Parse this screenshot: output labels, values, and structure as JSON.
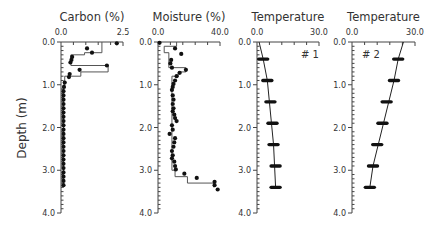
{
  "figure": {
    "ylabel": "Depth (m)",
    "depth_ticks": [
      0.0,
      1.0,
      2.0,
      3.0,
      4.0
    ],
    "depth_tick_labels": [
      "0.0",
      "1.0",
      "2.0",
      "3.0",
      "4.0"
    ]
  },
  "chart_data": [
    {
      "type": "scatter",
      "title": "Carbon (%)",
      "xlabel": "Carbon (%)",
      "ylabel": "Depth (m)",
      "xlim": [
        0.0,
        2.5
      ],
      "ylim": [
        4.0,
        0.0
      ],
      "xtick_labels": [
        "0.0",
        "2.5"
      ],
      "points": [
        {
          "x": 2.25,
          "y": 0.03
        },
        {
          "x": 1.05,
          "y": 0.15
        },
        {
          "x": 1.25,
          "y": 0.25
        },
        {
          "x": 0.45,
          "y": 0.35
        },
        {
          "x": 0.42,
          "y": 0.42
        },
        {
          "x": 0.38,
          "y": 0.48
        },
        {
          "x": 1.85,
          "y": 0.55
        },
        {
          "x": 0.75,
          "y": 0.65
        },
        {
          "x": 0.35,
          "y": 0.75
        },
        {
          "x": 0.32,
          "y": 0.82
        },
        {
          "x": 0.15,
          "y": 0.95
        },
        {
          "x": 0.12,
          "y": 1.05
        },
        {
          "x": 0.1,
          "y": 1.15
        },
        {
          "x": 0.1,
          "y": 1.25
        },
        {
          "x": 0.1,
          "y": 1.35
        },
        {
          "x": 0.1,
          "y": 1.45
        },
        {
          "x": 0.1,
          "y": 1.55
        },
        {
          "x": 0.1,
          "y": 1.65
        },
        {
          "x": 0.1,
          "y": 1.75
        },
        {
          "x": 0.1,
          "y": 1.85
        },
        {
          "x": 0.1,
          "y": 1.95
        },
        {
          "x": 0.1,
          "y": 2.05
        },
        {
          "x": 0.1,
          "y": 2.15
        },
        {
          "x": 0.1,
          "y": 2.25
        },
        {
          "x": 0.1,
          "y": 2.35
        },
        {
          "x": 0.1,
          "y": 2.45
        },
        {
          "x": 0.1,
          "y": 2.55
        },
        {
          "x": 0.1,
          "y": 2.65
        },
        {
          "x": 0.1,
          "y": 2.75
        },
        {
          "x": 0.1,
          "y": 2.85
        },
        {
          "x": 0.1,
          "y": 2.95
        },
        {
          "x": 0.1,
          "y": 3.05
        },
        {
          "x": 0.1,
          "y": 3.15
        },
        {
          "x": 0.1,
          "y": 3.25
        },
        {
          "x": 0.1,
          "y": 3.35
        }
      ],
      "step_profile": [
        [
          1.65,
          0.0
        ],
        [
          1.65,
          0.25
        ],
        [
          0.95,
          0.25
        ],
        [
          0.95,
          0.3
        ],
        [
          0.4,
          0.3
        ],
        [
          0.4,
          0.55
        ],
        [
          1.9,
          0.55
        ],
        [
          1.9,
          0.7
        ],
        [
          0.8,
          0.7
        ],
        [
          0.8,
          0.8
        ],
        [
          0.15,
          0.8
        ],
        [
          0.15,
          1.0
        ],
        [
          0.1,
          1.0
        ],
        [
          0.1,
          3.4
        ]
      ]
    },
    {
      "type": "scatter",
      "title": "Moisture (%)",
      "xlabel": "Moisture (%)",
      "ylabel": "Depth (m)",
      "xlim": [
        0.0,
        40.0
      ],
      "ylim": [
        4.0,
        0.0
      ],
      "xtick_labels": [
        "0.0",
        "40.0"
      ],
      "points": [
        {
          "x": 1.0,
          "y": 0.02
        },
        {
          "x": 11.0,
          "y": 0.15
        },
        {
          "x": 15.0,
          "y": 0.28
        },
        {
          "x": 8.5,
          "y": 0.42
        },
        {
          "x": 8.0,
          "y": 0.5
        },
        {
          "x": 9.0,
          "y": 0.6
        },
        {
          "x": 18.0,
          "y": 0.65
        },
        {
          "x": 14.0,
          "y": 0.72
        },
        {
          "x": 12.0,
          "y": 0.8
        },
        {
          "x": 11.0,
          "y": 0.9
        },
        {
          "x": 10.0,
          "y": 0.98
        },
        {
          "x": 9.5,
          "y": 1.05
        },
        {
          "x": 9.0,
          "y": 1.12
        },
        {
          "x": 9.5,
          "y": 1.25
        },
        {
          "x": 10.0,
          "y": 1.35
        },
        {
          "x": 9.5,
          "y": 1.45
        },
        {
          "x": 10.0,
          "y": 1.55
        },
        {
          "x": 9.5,
          "y": 1.62
        },
        {
          "x": 10.5,
          "y": 1.7
        },
        {
          "x": 11.0,
          "y": 1.78
        },
        {
          "x": 12.0,
          "y": 1.85
        },
        {
          "x": 9.0,
          "y": 1.95
        },
        {
          "x": 9.5,
          "y": 2.05
        },
        {
          "x": 7.5,
          "y": 2.15
        },
        {
          "x": 11.0,
          "y": 2.25
        },
        {
          "x": 10.5,
          "y": 2.35
        },
        {
          "x": 10.0,
          "y": 2.45
        },
        {
          "x": 9.0,
          "y": 2.55
        },
        {
          "x": 9.5,
          "y": 2.65
        },
        {
          "x": 9.0,
          "y": 2.72
        },
        {
          "x": 10.5,
          "y": 2.8
        },
        {
          "x": 11.0,
          "y": 2.9
        },
        {
          "x": 11.5,
          "y": 2.98
        },
        {
          "x": 17.0,
          "y": 3.08
        },
        {
          "x": 25.0,
          "y": 3.18
        },
        {
          "x": 36.5,
          "y": 3.27
        },
        {
          "x": 36.5,
          "y": 3.35
        },
        {
          "x": 38.5,
          "y": 3.45
        }
      ],
      "step_profile": [
        [
          12.0,
          0.0
        ],
        [
          12.0,
          0.1
        ],
        [
          4.0,
          0.1
        ],
        [
          4.0,
          0.25
        ],
        [
          7.0,
          0.25
        ],
        [
          7.0,
          0.6
        ],
        [
          18.0,
          0.6
        ],
        [
          18.0,
          0.7
        ],
        [
          13.0,
          0.7
        ],
        [
          13.0,
          0.8
        ],
        [
          9.0,
          0.8
        ],
        [
          9.0,
          3.0
        ],
        [
          11.0,
          3.0
        ],
        [
          11.0,
          3.15
        ],
        [
          19.0,
          3.15
        ],
        [
          19.0,
          3.3
        ],
        [
          36.0,
          3.3
        ],
        [
          36.0,
          3.4
        ]
      ]
    },
    {
      "type": "line",
      "title": "Temperature",
      "annotation": "# 1",
      "xlabel": "Temperature",
      "ylabel": "Depth (m)",
      "xlim": [
        0.0,
        30.0
      ],
      "ylim": [
        4.0,
        0.0
      ],
      "xtick_labels": [
        "0.0",
        "30.0"
      ],
      "line": [
        [
          1.0,
          0.0
        ],
        [
          3.0,
          0.4
        ],
        [
          5.0,
          0.9
        ],
        [
          6.0,
          1.4
        ],
        [
          7.0,
          1.9
        ],
        [
          8.0,
          2.4
        ],
        [
          8.5,
          2.9
        ],
        [
          9.0,
          3.4
        ]
      ],
      "measurements": [
        {
          "x": 3.0,
          "y": 0.4
        },
        {
          "x": 5.0,
          "y": 0.9
        },
        {
          "x": 6.5,
          "y": 1.4
        },
        {
          "x": 7.5,
          "y": 1.9
        },
        {
          "x": 8.0,
          "y": 2.4
        },
        {
          "x": 9.0,
          "y": 2.9
        },
        {
          "x": 9.0,
          "y": 3.4
        }
      ]
    },
    {
      "type": "line",
      "title": "Temperature",
      "annotation": "# 2",
      "xlabel": "Temperature",
      "ylabel": "Depth (m)",
      "xlim": [
        0.0,
        30.0
      ],
      "ylim": [
        4.0,
        0.0
      ],
      "xtick_labels": [
        "0.0",
        "30.0"
      ],
      "line": [
        [
          24.5,
          0.0
        ],
        [
          22.0,
          0.4
        ],
        [
          20.0,
          0.9
        ],
        [
          17.5,
          1.4
        ],
        [
          15.0,
          1.9
        ],
        [
          12.5,
          2.4
        ],
        [
          10.0,
          2.9
        ],
        [
          8.5,
          3.4
        ]
      ],
      "measurements": [
        {
          "x": 22.0,
          "y": 0.4
        },
        {
          "x": 20.0,
          "y": 0.9
        },
        {
          "x": 16.5,
          "y": 1.4
        },
        {
          "x": 14.5,
          "y": 1.9
        },
        {
          "x": 12.0,
          "y": 2.4
        },
        {
          "x": 10.0,
          "y": 2.9
        },
        {
          "x": 8.5,
          "y": 3.4
        }
      ]
    }
  ]
}
